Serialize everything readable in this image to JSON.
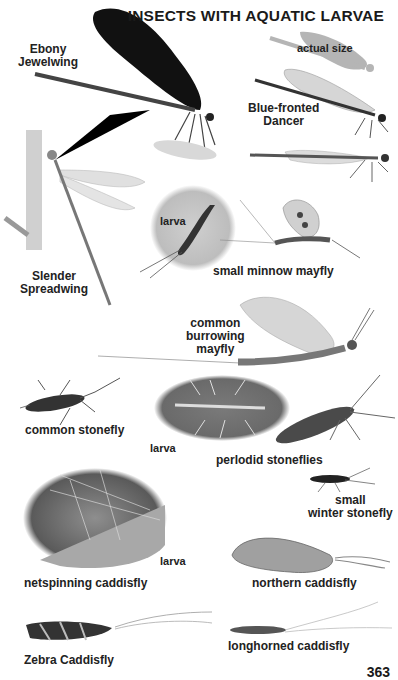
{
  "page": {
    "title": "INSECTS WITH AQUATIC LARVAE",
    "page_number": "363"
  },
  "species": [
    {
      "id": "ebony-jewelwing",
      "label_lines": [
        "Ebony",
        "Jewelwing"
      ]
    },
    {
      "id": "actual-size",
      "label_lines": [
        "actual size"
      ]
    },
    {
      "id": "blue-fronted-dancer",
      "label_lines": [
        "Blue-fronted",
        "Dancer"
      ]
    },
    {
      "id": "slender-spreadwing",
      "label_lines": [
        "Slender",
        "Spreadwing"
      ]
    },
    {
      "id": "small-minnow-mayfly",
      "label_lines": [
        "small minnow mayfly"
      ],
      "larva_label": "larva"
    },
    {
      "id": "common-burrowing-mayfly",
      "label_lines": [
        "common",
        "burrowing",
        "mayfly"
      ]
    },
    {
      "id": "common-stonefly",
      "label_lines": [
        "common stonefly"
      ]
    },
    {
      "id": "perlodid-stoneflies",
      "label_lines": [
        "perlodid stoneflies"
      ],
      "larva_label": "larva"
    },
    {
      "id": "small-winter-stonefly",
      "label_lines": [
        "small",
        "winter stonefly"
      ]
    },
    {
      "id": "netspinning-caddisfly",
      "label_lines": [
        "netspinning caddisfly"
      ],
      "larva_label": "larva"
    },
    {
      "id": "northern-caddisfly",
      "label_lines": [
        "northern caddisfly"
      ]
    },
    {
      "id": "zebra-caddisfly",
      "label_lines": [
        "Zebra Caddisfly"
      ]
    },
    {
      "id": "longhorned-caddisfly",
      "label_lines": [
        "longhorned caddisfly"
      ]
    }
  ]
}
